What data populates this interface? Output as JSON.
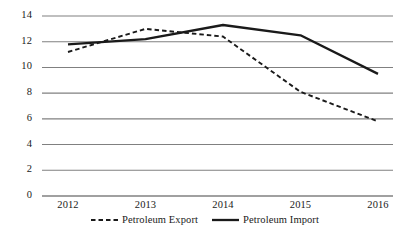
{
  "chart_data": {
    "type": "line",
    "title": "",
    "xlabel": "",
    "ylabel": "",
    "categories": [
      "2012",
      "2013",
      "2014",
      "2015",
      "2016"
    ],
    "x": [
      2012,
      2013,
      2014,
      2015,
      2016
    ],
    "series": [
      {
        "name": "Petroleum Export",
        "values": [
          11.2,
          13.0,
          12.4,
          8.1,
          5.8
        ],
        "style": "dashed",
        "color": "#1a1a1a"
      },
      {
        "name": "Petroleum Import",
        "values": [
          11.8,
          12.2,
          13.3,
          12.5,
          9.5
        ],
        "style": "solid",
        "color": "#1a1a1a"
      }
    ],
    "ylim": [
      0,
      14
    ],
    "yticks": [
      0,
      2,
      4,
      6,
      8,
      10,
      12,
      14
    ],
    "ytick_labels": [
      "0",
      "2",
      "4",
      "6",
      "8",
      "10",
      "12",
      "14"
    ],
    "grid": true,
    "grid_axis": "y",
    "grid_color": "#808080",
    "legend_position": "bottom",
    "legend": [
      "Petroleum Export",
      "Petroleum Import"
    ]
  },
  "axis": {
    "y_labels": [
      "14",
      "12",
      "10",
      "8",
      "6",
      "4",
      "2",
      "0"
    ],
    "x_labels": [
      "2012",
      "2013",
      "2014",
      "2015",
      "2016"
    ]
  },
  "legend": {
    "entries": [
      {
        "label": "Petroleum Export",
        "marker": "dashed-line-icon"
      },
      {
        "label": "Petroleum Import",
        "marker": "solid-line-icon"
      }
    ]
  }
}
